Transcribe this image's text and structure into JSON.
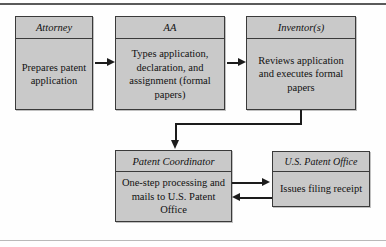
{
  "diagram": {
    "colors": {
      "node_fill": "#c9c9c9",
      "node_border": "#3a3a3a",
      "connector": "#1c1c1c",
      "rule": "#5a5a5a",
      "background": "#fefefe"
    },
    "nodes": [
      {
        "id": "attorney",
        "header": "Attorney",
        "body": "Prepares patent application"
      },
      {
        "id": "aa",
        "header": "AA",
        "body": "Types application, declaration, and assignment (formal papers)"
      },
      {
        "id": "inventors",
        "header": "Inventor(s)",
        "body": "Reviews application and executes formal papers"
      },
      {
        "id": "coordinator",
        "header": "Patent Coordinator",
        "body": "One-step processing and mails to U.S. Patent Office"
      },
      {
        "id": "uspto",
        "header": "U.S. Patent Office",
        "body": "Issues filing receipt"
      }
    ],
    "connectors": [
      {
        "id": "attorney-aa",
        "from": "attorney",
        "to": "aa",
        "shape": "straight",
        "direction": "right"
      },
      {
        "id": "aa-inventors",
        "from": "aa",
        "to": "inventors",
        "shape": "straight",
        "direction": "right"
      },
      {
        "id": "inventors-coordinator",
        "from": "inventors",
        "to": "coordinator",
        "shape": "elbow",
        "direction": "down"
      },
      {
        "id": "coordinator-uspto",
        "from": "coordinator",
        "to": "uspto",
        "shape": "straight",
        "direction": "right"
      },
      {
        "id": "uspto-coordinator",
        "from": "uspto",
        "to": "coordinator",
        "shape": "straight",
        "direction": "left"
      }
    ]
  }
}
